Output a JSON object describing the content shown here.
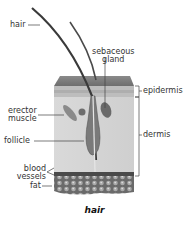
{
  "diagram": {
    "caption": "hair",
    "labels": {
      "hair": "hair",
      "sebaceous_gland": "sebaceous\ngland",
      "sebaceous_line1": "sebaceous",
      "sebaceous_line2": "gland",
      "epidermis": "epidermis",
      "erector_line1": "erector",
      "erector_line2": "muscle",
      "dermis": "dermis",
      "follicle": "follicle",
      "blood_line1": "blood",
      "blood_line2": "vessels",
      "fat": "fat"
    }
  }
}
